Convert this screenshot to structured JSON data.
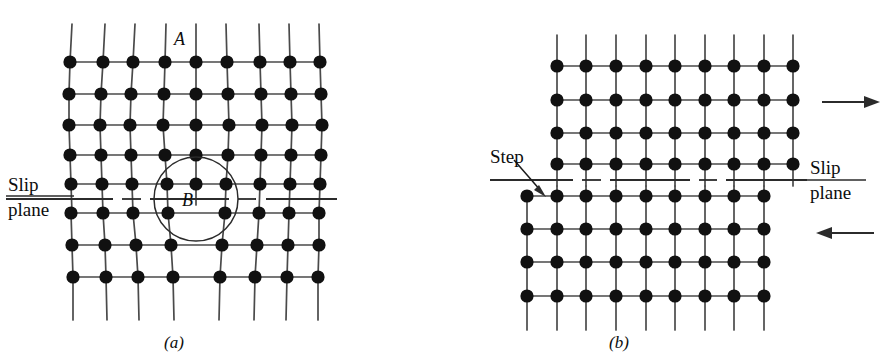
{
  "figure": {
    "background_color": "#ffffff",
    "atom_color": "#111111",
    "line_color": "#4a4a4a",
    "label_color": "#0d0d0d"
  },
  "panel_a": {
    "caption": "(a)",
    "labels": {
      "extra_half_plane": "A",
      "dislocation_core": "B",
      "slip_top": "Slip",
      "slip_bottom": "plane"
    },
    "description": "Edge dislocation with extra half-plane A terminating at core B on the slip plane",
    "rows_above_slip": 5,
    "rows_below_slip": 3,
    "columns_above_slip": 9,
    "columns_below_slip": 8,
    "slip_plane_style": "dashed"
  },
  "panel_b": {
    "caption": "(b)",
    "labels": {
      "step": "Step",
      "slip_top": "Slip",
      "slip_bottom": "plane"
    },
    "description": "Lattice after the dislocation has passed, leaving a unit step at the left surface",
    "rows_above_slip": 4,
    "rows_below_slip": 4,
    "columns_above_slip": 9,
    "columns_below_slip": 9,
    "slip_plane_style": "dashed",
    "shear_arrows": [
      {
        "name": "top-shear-arrow",
        "direction": "right"
      },
      {
        "name": "bottom-shear-arrow",
        "direction": "left"
      }
    ]
  }
}
